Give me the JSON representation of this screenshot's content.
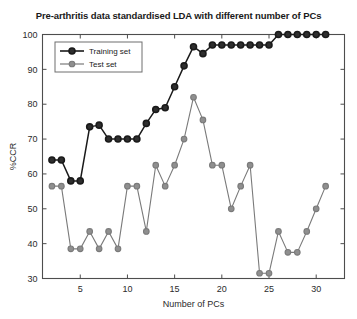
{
  "chart_data": {
    "type": "line",
    "title": "Pre-arthritis data standardised LDA with different number of PCs",
    "xlabel": "Number of PCs",
    "ylabel": "%CCR",
    "xlim": [
      1,
      33
    ],
    "ylim": [
      30,
      100
    ],
    "xticks": [
      5,
      10,
      15,
      20,
      25,
      30
    ],
    "yticks": [
      30,
      40,
      50,
      60,
      70,
      80,
      90,
      100
    ],
    "grid": false,
    "legend_position": "upper left",
    "x": [
      2,
      3,
      4,
      5,
      6,
      7,
      8,
      9,
      10,
      11,
      12,
      13,
      14,
      15,
      16,
      17,
      18,
      19,
      20,
      21,
      22,
      23,
      24,
      25,
      26,
      27,
      28,
      29,
      30,
      31
    ],
    "series": [
      {
        "name": "Training set",
        "color": "#1a1a1a",
        "marker": "o",
        "values": [
          64,
          64,
          58,
          58,
          73.5,
          74,
          70,
          70,
          70,
          70,
          74.5,
          78.5,
          79,
          85,
          91,
          96.5,
          94.5,
          97,
          97,
          97,
          97,
          97,
          97,
          97,
          100,
          100,
          100,
          100,
          100,
          100
        ]
      },
      {
        "name": "Test set",
        "color": "#7a7a7a",
        "marker": "o",
        "values": [
          56.5,
          56.5,
          38.5,
          38.5,
          43.5,
          38.5,
          43.5,
          38.5,
          56.5,
          56.5,
          43.5,
          62.5,
          56.5,
          62.5,
          70,
          82,
          75.5,
          62.5,
          62.5,
          50,
          56.5,
          62.5,
          31.5,
          31.5,
          43.5,
          37.5,
          37.5,
          43.5,
          50,
          56.5
        ]
      }
    ]
  },
  "legend": {
    "items": [
      {
        "label": "Training set"
      },
      {
        "label": "Test set"
      }
    ]
  },
  "axes": {
    "y_tick_labels": [
      "100",
      "90",
      "80",
      "70",
      "60",
      "50",
      "40",
      "30"
    ],
    "x_tick_labels": [
      "5",
      "10",
      "15",
      "20",
      "25",
      "30"
    ]
  }
}
